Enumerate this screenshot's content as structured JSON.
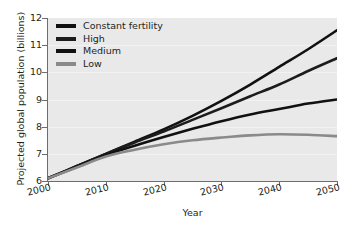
{
  "chart_data": {
    "type": "line",
    "title": "",
    "xlabel": "Year",
    "ylabel": "Projected global population (billions)",
    "xlim": [
      2000,
      2050
    ],
    "ylim": [
      6,
      12
    ],
    "xticks": [
      "2000",
      "2010",
      "2020",
      "2030",
      "2040",
      "2050"
    ],
    "yticks": [
      "12",
      "11",
      "10",
      "9",
      "8",
      "7",
      "6"
    ],
    "grid": "horizontal",
    "legend_position": "top-left",
    "x": [
      2000,
      2005,
      2010,
      2015,
      2020,
      2025,
      2030,
      2035,
      2040,
      2045,
      2050
    ],
    "series": [
      {
        "name": "Constant fertility",
        "color": "#111111",
        "values": [
          6.1,
          6.55,
          7.0,
          7.45,
          7.9,
          8.4,
          8.95,
          9.55,
          10.2,
          10.85,
          11.55
        ]
      },
      {
        "name": "High",
        "color": "#1c1c1c",
        "values": [
          6.1,
          6.55,
          7.0,
          7.42,
          7.82,
          8.25,
          8.68,
          9.12,
          9.55,
          10.05,
          10.52
        ]
      },
      {
        "name": "Medium",
        "color": "#111111",
        "values": [
          6.1,
          6.52,
          6.95,
          7.3,
          7.62,
          7.92,
          8.2,
          8.45,
          8.65,
          8.85,
          9.0
        ]
      },
      {
        "name": "Low",
        "color": "#8a8a8a",
        "values": [
          6.1,
          6.5,
          6.9,
          7.15,
          7.35,
          7.5,
          7.6,
          7.68,
          7.72,
          7.7,
          7.65
        ]
      }
    ]
  },
  "legend": {
    "items": [
      {
        "label": "Constant fertility",
        "color": "#111111"
      },
      {
        "label": "High",
        "color": "#1c1c1c"
      },
      {
        "label": "Medium",
        "color": "#111111"
      },
      {
        "label": "Low",
        "color": "#8a8a8a"
      }
    ]
  },
  "axes": {
    "y_title": "Projected global population (billions)",
    "x_title": "Year",
    "y_tick_labels": [
      "12",
      "11",
      "10",
      "9",
      "8",
      "7",
      "6"
    ],
    "x_tick_labels": [
      "2000",
      "2010",
      "2020",
      "2030",
      "2040",
      "2050"
    ]
  },
  "style": {
    "plot_background": "#e9e9e9",
    "page_background": "#ffffff",
    "gridline_color": "#f2f2f2",
    "axis_color": "#6d6d6d",
    "text_color": "#231f20"
  }
}
